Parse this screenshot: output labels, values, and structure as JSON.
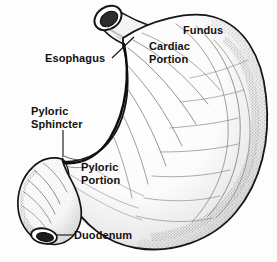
{
  "figure": {
    "style": "pen-and-ink stippled medical illustration",
    "width": 277,
    "height": 262,
    "background_color": "#fdfdfd",
    "ink_color": "#111111",
    "shading_color": "#6f6f6f"
  },
  "labels": {
    "fundus": "Fundus",
    "cardiac_portion": "Cardiac\nPortion",
    "esophagus": "Esophagus",
    "pyloric_sphincter": "Pyloric\nSphincter",
    "pyloric_portion": "Pyloric\nPortion",
    "duodenum": "Duodenum"
  },
  "parts": [
    {
      "id": "esophagus",
      "label": "Esophagus",
      "leader": "diagonal"
    },
    {
      "id": "fundus",
      "label": "Fundus",
      "leader": "none"
    },
    {
      "id": "cardiac-portion",
      "label": "Cardiac Portion",
      "leader": "none"
    },
    {
      "id": "pyloric-sphincter",
      "label": "Pyloric Sphincter",
      "leader": "vertical"
    },
    {
      "id": "pyloric-portion",
      "label": "Pyloric Portion",
      "leader": "none"
    },
    {
      "id": "duodenum",
      "label": "Duodenum",
      "leader": "horizontal"
    }
  ]
}
